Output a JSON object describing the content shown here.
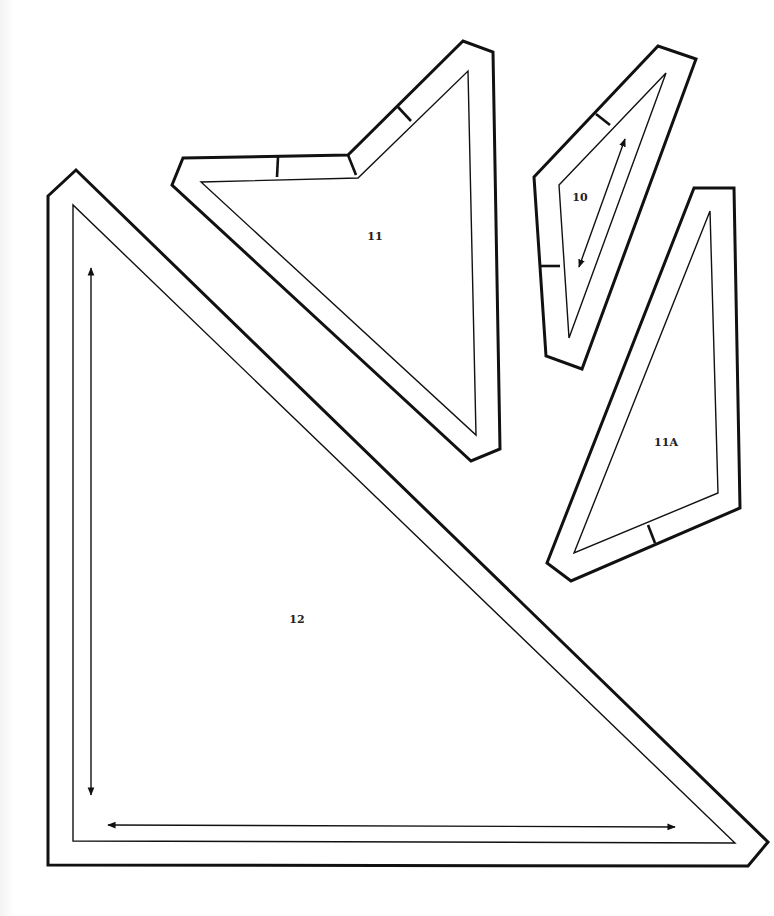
{
  "sheet": {
    "background": "#ffffff",
    "line_color": "#111111"
  },
  "pieces": [
    {
      "id": "piece-12",
      "label": "12",
      "label_pos": [
        297,
        623
      ],
      "outer": "48,196 76,170 768,842 748,866 48,865",
      "inner": "73,205 73,841 735,843",
      "grain_arrows": [
        [
          91,
          268,
          91,
          795
        ],
        [
          108,
          825,
          675,
          827
        ]
      ],
      "ticks": []
    },
    {
      "id": "piece-11",
      "label": "11",
      "label_pos": [
        375,
        240
      ],
      "outer": "183,158 348,155 463,41 493,52 500,449 471,461 172,185",
      "inner": "201,182 358,178 468,71 476,435",
      "grain_arrows": [],
      "ticks": [
        [
          278,
          157,
          277,
          177
        ],
        [
          398,
          107,
          411,
          121
        ],
        [
          348,
          155,
          356,
          175
        ]
      ]
    },
    {
      "id": "piece-10",
      "label": "10",
      "label_pos": [
        580,
        201
      ],
      "outer": "534,177 658,46 696,59 582,369 546,356",
      "inner": "559,185 666,73 569,338",
      "grain_arrows": [
        [
          625,
          139,
          579,
          267
        ]
      ],
      "ticks": [
        [
          596,
          114,
          610,
          125
        ],
        [
          540,
          266,
          560,
          266
        ]
      ]
    },
    {
      "id": "piece-11A",
      "label": "11A",
      "label_pos": [
        666,
        446
      ],
      "outer": "694,188 734,188 740,508 571,581 547,563",
      "inner": "710,211 718,493 574,553",
      "grain_arrows": [],
      "ticks": [
        [
          648,
          525,
          655,
          543
        ]
      ]
    }
  ]
}
